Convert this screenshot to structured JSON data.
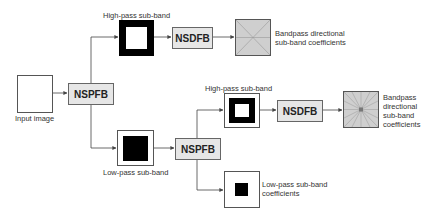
{
  "diagram": {
    "input_image": {
      "label": "Input image"
    },
    "nspfb_1": {
      "label": "NSPFB"
    },
    "highpass_1": {
      "label": "High-pass sub-band"
    },
    "nsdfb_1": {
      "label": "NSDFB"
    },
    "bandpass_1": {
      "label_line1": "Bandpass directional",
      "label_line2": "sub-band coefficients"
    },
    "lowpass_1": {
      "label": "Low-pass sub-band"
    },
    "nspfb_2": {
      "label": "NSPFB"
    },
    "highpass_2": {
      "label": "High-pass sub-band"
    },
    "nsdfb_2": {
      "label": "NSDFB"
    },
    "bandpass_2": {
      "label_line1": "Bandpass",
      "label_line2": "directional",
      "label_line3": "sub-band",
      "label_line4": "coefficients"
    },
    "lowpass_2": {
      "label_line1": "Low-pass sub-band",
      "label_line2": "coefficients"
    }
  },
  "colors": {
    "block_fill": "#e6e6e6",
    "bandpass_fill": "#cfcfcf",
    "line": "#444444",
    "black": "#000000"
  }
}
